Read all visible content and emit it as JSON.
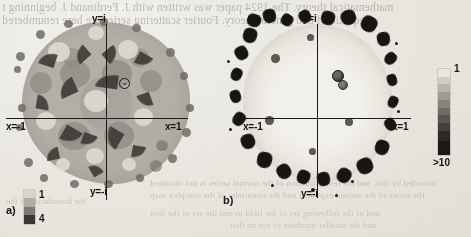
{
  "page": {
    "background_color": "#eceae4",
    "ink_color": "#17150f"
  },
  "bleed_text": {
    "top_line_1": "mathematical theory. The 1924 paper was written with J. Ferdinand J. beginning t",
    "top_line_2": "equation f and general theory. Fourier scattering series are here renumbered",
    "bottom_line_1": "bounded by this, and the reconstruction of the normal series is not obtained",
    "bottom_line_2": "the series of the second exponent and the remainder of the complex map",
    "bottom_line_3": "and of the following set of the field in and the set of the first",
    "bottom_line_4": "and the smaller numbers of not on that",
    "left_line_1": "the boundaries of the"
  },
  "figures": [
    {
      "id": "a",
      "caption_label": "a)",
      "axes": {
        "top_label": "y=i",
        "bottom_label": "y=-i",
        "left_label": "x=-1",
        "right_label": "x=1"
      },
      "legend": {
        "top_value": "1",
        "bottom_value": "4",
        "levels": 4,
        "colors": [
          "#d8d5cd",
          "#b0ada5",
          "#7d7a73",
          "#3a3833"
        ]
      },
      "marker": {
        "type": "open-circle",
        "description": "critical point marker"
      }
    },
    {
      "id": "b",
      "caption_label": "b)",
      "axes": {
        "top_label": "y=i",
        "bottom_label": "y=-i",
        "left_label": "x=-1",
        "right_label": "x=1"
      },
      "legend": {
        "top_value": "1",
        "bottom_value": ">10",
        "levels": 10,
        "colors": [
          "#e9e7e0",
          "#cfccc4",
          "#b8b5ad",
          "#9e9b94",
          "#87847d",
          "#6f6c65",
          "#58554f",
          "#433f3a",
          "#2e2b27",
          "#1b1915"
        ]
      },
      "marker": {
        "type": "filled-circle",
        "description": "critical point marker"
      }
    }
  ]
}
